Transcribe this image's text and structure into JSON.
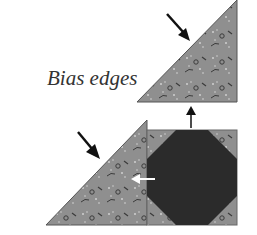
{
  "diagram": {
    "label": "Bias edges",
    "colors": {
      "fabric": "#8f8f8f",
      "fabric_light": "#b3b3b3",
      "fabric_dark": "#3a3a3a",
      "octagon": "#2b2b2b",
      "arrow": "#111111",
      "arrow_white": "#ffffff",
      "text": "#333333"
    },
    "parts": [
      {
        "name": "top-half-square-triangle",
        "type": "triangle"
      },
      {
        "name": "bottom-left-triangle",
        "type": "triangle"
      },
      {
        "name": "snowball-square",
        "type": "square-with-octagon"
      }
    ],
    "arrows": [
      {
        "name": "bias-edge-arrow-top",
        "direction": "down-right"
      },
      {
        "name": "bias-edge-arrow-bottom",
        "direction": "down-right"
      },
      {
        "name": "assembly-arrow-up",
        "direction": "up"
      },
      {
        "name": "assembly-arrow-left",
        "direction": "left"
      }
    ]
  }
}
